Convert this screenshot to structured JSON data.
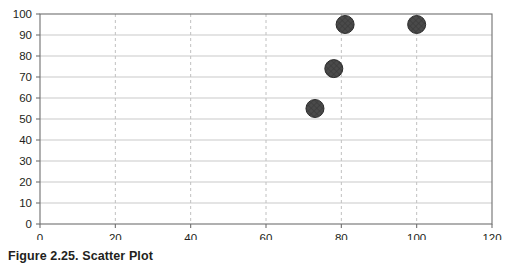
{
  "caption": "Figure 2.25. Scatter Plot",
  "chart_data": {
    "type": "scatter",
    "title": "",
    "subtitle": "",
    "xlabel": "",
    "ylabel": "",
    "xlim": [
      0,
      120
    ],
    "ylim": [
      0,
      100
    ],
    "xticks": [
      0,
      20,
      40,
      60,
      80,
      100,
      120
    ],
    "yticks": [
      0,
      10,
      20,
      30,
      40,
      50,
      60,
      70,
      80,
      90,
      100
    ],
    "grid": {
      "horizontal": true,
      "vertical": true,
      "horizontal_style": "solid",
      "vertical_style": "dashed"
    },
    "legend": null,
    "series": [
      {
        "name": "",
        "marker": "circle",
        "marker_color": "#4a4a4a",
        "marker_size": 9,
        "points": [
          {
            "x": 73,
            "y": 55
          },
          {
            "x": 78,
            "y": 74
          },
          {
            "x": 81,
            "y": 95
          },
          {
            "x": 100,
            "y": 95
          }
        ]
      }
    ],
    "x": [
      73,
      78,
      81,
      100
    ],
    "y": [
      55,
      74,
      95,
      95
    ],
    "marker_fill": "#4a4a4a",
    "plot_background": "#ffffff"
  }
}
